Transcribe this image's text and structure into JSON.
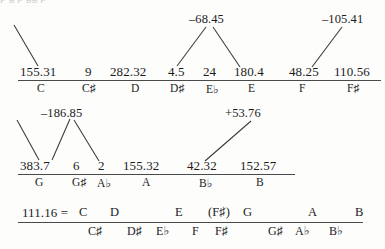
{
  "figure": {
    "type": "pitch-class-deviation-table",
    "cut_off_top_text": "p      g                                 p    gg p",
    "rows": [
      {
        "id": "row-1",
        "values": [
          "155.31",
          "9",
          "282.32",
          "4.5",
          "24",
          "180.4",
          "48.25",
          "110.56"
        ],
        "notes": [
          "C",
          "C♯",
          "D",
          "D♯",
          "E♭",
          "E",
          "F",
          "F♯"
        ],
        "annotations": [
          "–68.45",
          "–105.41"
        ]
      },
      {
        "id": "row-2",
        "values": [
          "383.7",
          "6",
          "2",
          "155.32",
          "42.32",
          "152.57"
        ],
        "notes": [
          "G",
          "G♯",
          "A♭",
          "A",
          "B♭",
          "B"
        ],
        "annotations": [
          "–186.85",
          "+53.76"
        ]
      },
      {
        "id": "row-3",
        "lead_value": "111.16 =",
        "upper_notes": [
          "C",
          "D",
          "E",
          "(F♯)",
          "G",
          "A",
          "B"
        ],
        "lower_notes": [
          "C♯",
          "D♯",
          "E♭",
          "F",
          "F♯",
          "G♯",
          "A♭",
          "B♭"
        ]
      }
    ]
  },
  "colors": {
    "ink": "#1c1c1c",
    "rule": "#4a4a4a",
    "paper": "#fdfdfc"
  }
}
